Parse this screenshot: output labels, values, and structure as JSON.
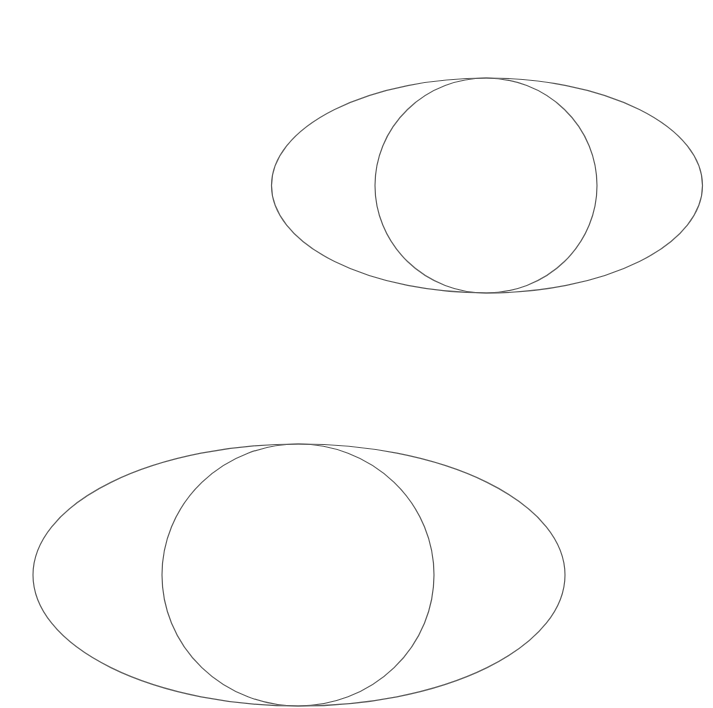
{
  "canvas": {
    "width": 713,
    "height": 708,
    "background": "#ffffff"
  },
  "style": {
    "stroke": "#5f5f5f",
    "stroke_width": 1.2
  },
  "figures": [
    {
      "name": "upper-figure",
      "ellipse": {
        "cx": 487,
        "cy": 185.5,
        "rx": 215.5,
        "ry": 107.5
      },
      "circle": {
        "cx": 486,
        "cy": 185.5,
        "rx": 111,
        "ry": 107.5
      }
    },
    {
      "name": "lower-figure",
      "ellipse": {
        "cx": 299,
        "cy": 575,
        "rx": 266,
        "ry": 131
      },
      "circle": {
        "cx": 298,
        "cy": 575,
        "rx": 136,
        "ry": 131
      }
    }
  ]
}
